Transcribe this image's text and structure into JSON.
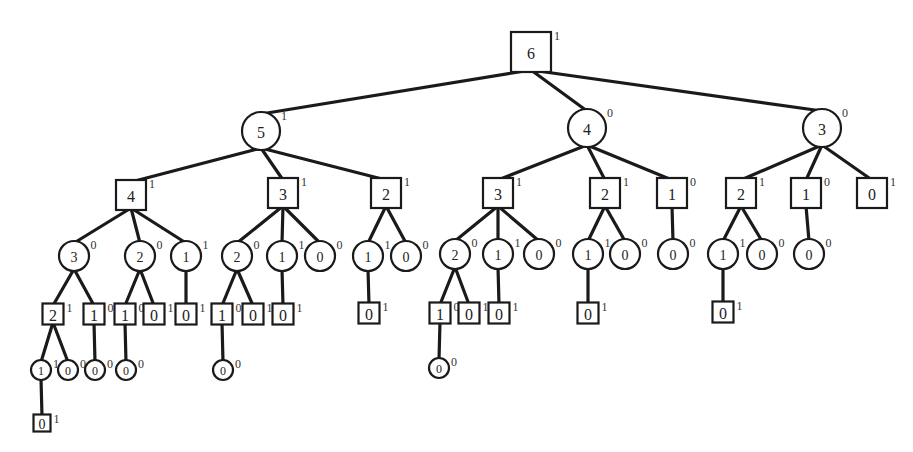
{
  "diagram": {
    "type": "game-tree",
    "nodes": [
      {
        "id": "n0",
        "shape": "square",
        "value": "6",
        "label": "1",
        "x": 531,
        "y": 52,
        "size": 40,
        "parent": null
      },
      {
        "id": "n1",
        "shape": "circle",
        "value": "5",
        "label": "1",
        "x": 261,
        "y": 131,
        "size": 19,
        "parent": "n0"
      },
      {
        "id": "n2",
        "shape": "circle",
        "value": "4",
        "label": "0",
        "x": 587,
        "y": 128,
        "size": 19,
        "parent": "n0"
      },
      {
        "id": "n3",
        "shape": "circle",
        "value": "3",
        "label": "0",
        "x": 822,
        "y": 128,
        "size": 19,
        "parent": "n0"
      },
      {
        "id": "n4",
        "shape": "square",
        "value": "4",
        "label": "1",
        "x": 131,
        "y": 195,
        "size": 30,
        "parent": "n1"
      },
      {
        "id": "n5",
        "shape": "square",
        "value": "3",
        "label": "1",
        "x": 283,
        "y": 193,
        "size": 30,
        "parent": "n1"
      },
      {
        "id": "n6",
        "shape": "square",
        "value": "2",
        "label": "1",
        "x": 386,
        "y": 193,
        "size": 30,
        "parent": "n1"
      },
      {
        "id": "n7",
        "shape": "square",
        "value": "3",
        "label": "1",
        "x": 498,
        "y": 193,
        "size": 30,
        "parent": "n2"
      },
      {
        "id": "n8",
        "shape": "square",
        "value": "2",
        "label": "1",
        "x": 605,
        "y": 193,
        "size": 30,
        "parent": "n2"
      },
      {
        "id": "n9",
        "shape": "square",
        "value": "1",
        "label": "0",
        "x": 672,
        "y": 193,
        "size": 30,
        "parent": "n2"
      },
      {
        "id": "n10",
        "shape": "square",
        "value": "2",
        "label": "1",
        "x": 741,
        "y": 193,
        "size": 30,
        "parent": "n3"
      },
      {
        "id": "n11",
        "shape": "square",
        "value": "1",
        "label": "0",
        "x": 806,
        "y": 193,
        "size": 30,
        "parent": "n3"
      },
      {
        "id": "n12",
        "shape": "square",
        "value": "0",
        "label": "1",
        "x": 872,
        "y": 193,
        "size": 30,
        "parent": "n3"
      },
      {
        "id": "n13",
        "shape": "circle",
        "value": "3",
        "label": "0",
        "x": 74,
        "y": 256,
        "size": 15,
        "parent": "n4"
      },
      {
        "id": "n14",
        "shape": "circle",
        "value": "2",
        "label": "0",
        "x": 140,
        "y": 256,
        "size": 15,
        "parent": "n4"
      },
      {
        "id": "n15",
        "shape": "circle",
        "value": "1",
        "label": "1",
        "x": 186,
        "y": 256,
        "size": 15,
        "parent": "n4"
      },
      {
        "id": "n16",
        "shape": "circle",
        "value": "2",
        "label": "0",
        "x": 237,
        "y": 256,
        "size": 15,
        "parent": "n5"
      },
      {
        "id": "n17",
        "shape": "circle",
        "value": "1",
        "label": "1",
        "x": 282,
        "y": 256,
        "size": 15,
        "parent": "n5"
      },
      {
        "id": "n18",
        "shape": "circle",
        "value": "0",
        "label": "0",
        "x": 320,
        "y": 256,
        "size": 15,
        "parent": "n5"
      },
      {
        "id": "n19",
        "shape": "circle",
        "value": "1",
        "label": "1",
        "x": 368,
        "y": 256,
        "size": 15,
        "parent": "n6"
      },
      {
        "id": "n20",
        "shape": "circle",
        "value": "0",
        "label": "0",
        "x": 406,
        "y": 256,
        "size": 15,
        "parent": "n6"
      },
      {
        "id": "n21",
        "shape": "circle",
        "value": "2",
        "label": "0",
        "x": 455,
        "y": 254,
        "size": 15,
        "parent": "n7"
      },
      {
        "id": "n22",
        "shape": "circle",
        "value": "1",
        "label": "1",
        "x": 498,
        "y": 254,
        "size": 15,
        "parent": "n7"
      },
      {
        "id": "n23",
        "shape": "circle",
        "value": "0",
        "label": "0",
        "x": 539,
        "y": 254,
        "size": 15,
        "parent": "n7"
      },
      {
        "id": "n24",
        "shape": "circle",
        "value": "1",
        "label": "1",
        "x": 588,
        "y": 254,
        "size": 15,
        "parent": "n8"
      },
      {
        "id": "n25",
        "shape": "circle",
        "value": "0",
        "label": "0",
        "x": 625,
        "y": 254,
        "size": 15,
        "parent": "n8"
      },
      {
        "id": "n26",
        "shape": "circle",
        "value": "0",
        "label": "0",
        "x": 673,
        "y": 254,
        "size": 15,
        "parent": "n9"
      },
      {
        "id": "n27",
        "shape": "circle",
        "value": "1",
        "label": "1",
        "x": 723,
        "y": 254,
        "size": 15,
        "parent": "n10"
      },
      {
        "id": "n28",
        "shape": "circle",
        "value": "0",
        "label": "0",
        "x": 762,
        "y": 254,
        "size": 15,
        "parent": "n10"
      },
      {
        "id": "n29",
        "shape": "circle",
        "value": "0",
        "label": "0",
        "x": 809,
        "y": 254,
        "size": 15,
        "parent": "n11"
      },
      {
        "id": "n30",
        "shape": "square",
        "value": "2",
        "label": "1",
        "x": 53,
        "y": 314,
        "size": 21,
        "parent": "n13"
      },
      {
        "id": "n31",
        "shape": "square",
        "value": "1",
        "label": "0",
        "x": 94,
        "y": 314,
        "size": 21,
        "parent": "n13"
      },
      {
        "id": "n32",
        "shape": "square",
        "value": "1",
        "label": "0",
        "x": 125,
        "y": 314,
        "size": 21,
        "parent": "n14"
      },
      {
        "id": "n33",
        "shape": "square",
        "value": "0",
        "label": "1",
        "x": 154,
        "y": 314,
        "size": 21,
        "parent": "n14"
      },
      {
        "id": "n34",
        "shape": "square",
        "value": "0",
        "label": "1",
        "x": 186,
        "y": 314,
        "size": 21,
        "parent": "n15"
      },
      {
        "id": "n35",
        "shape": "square",
        "value": "1",
        "label": "0",
        "x": 222,
        "y": 314,
        "size": 21,
        "parent": "n16"
      },
      {
        "id": "n36",
        "shape": "square",
        "value": "0",
        "label": "1",
        "x": 253,
        "y": 314,
        "size": 21,
        "parent": "n16"
      },
      {
        "id": "n37",
        "shape": "square",
        "value": "0",
        "label": "1",
        "x": 283,
        "y": 314,
        "size": 21,
        "parent": "n17"
      },
      {
        "id": "n38",
        "shape": "square",
        "value": "0",
        "label": "1",
        "x": 369,
        "y": 313,
        "size": 21,
        "parent": "n19"
      },
      {
        "id": "n39",
        "shape": "square",
        "value": "1",
        "label": "0",
        "x": 440,
        "y": 313,
        "size": 21,
        "parent": "n21"
      },
      {
        "id": "n40",
        "shape": "square",
        "value": "0",
        "label": "1",
        "x": 469,
        "y": 313,
        "size": 21,
        "parent": "n21"
      },
      {
        "id": "n41",
        "shape": "square",
        "value": "0",
        "label": "1",
        "x": 499,
        "y": 313,
        "size": 21,
        "parent": "n22"
      },
      {
        "id": "n42",
        "shape": "square",
        "value": "0",
        "label": "1",
        "x": 588,
        "y": 313,
        "size": 21,
        "parent": "n24"
      },
      {
        "id": "n43",
        "shape": "square",
        "value": "0",
        "label": "1",
        "x": 723,
        "y": 312,
        "size": 21,
        "parent": "n27"
      },
      {
        "id": "n44",
        "shape": "circle",
        "value": "1",
        "label": "1",
        "x": 41,
        "y": 370,
        "size": 10,
        "parent": "n30"
      },
      {
        "id": "n45",
        "shape": "circle",
        "value": "0",
        "label": "0",
        "x": 68,
        "y": 370,
        "size": 10,
        "parent": "n30"
      },
      {
        "id": "n46",
        "shape": "circle",
        "value": "0",
        "label": "0",
        "x": 95,
        "y": 370,
        "size": 10,
        "parent": "n31"
      },
      {
        "id": "n47",
        "shape": "circle",
        "value": "0",
        "label": "0",
        "x": 126,
        "y": 370,
        "size": 10,
        "parent": "n32"
      },
      {
        "id": "n48",
        "shape": "circle",
        "value": "0",
        "label": "0",
        "x": 223,
        "y": 370,
        "size": 10,
        "parent": "n35"
      },
      {
        "id": "n49",
        "shape": "circle",
        "value": "0",
        "label": "0",
        "x": 439,
        "y": 368,
        "size": 10,
        "parent": "n39"
      },
      {
        "id": "n50",
        "shape": "square",
        "value": "0",
        "label": "1",
        "x": 42,
        "y": 423,
        "size": 17,
        "parent": "n44"
      }
    ]
  }
}
